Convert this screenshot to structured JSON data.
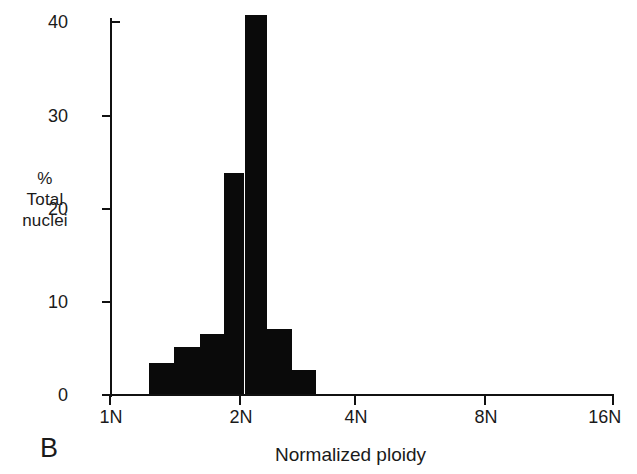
{
  "figure": {
    "panel_letter": "B",
    "background_color": "#ffffff",
    "ink_color": "#0a0a0a"
  },
  "axes": {
    "y_label_lines": [
      "%",
      "Total",
      "nuclei"
    ],
    "x_title": "Normalized ploidy",
    "y_ticks": [
      {
        "label": "0",
        "value": 0
      },
      {
        "label": "10",
        "value": 10
      },
      {
        "label": "20",
        "value": 20
      },
      {
        "label": "30",
        "value": 30
      },
      {
        "label": "40",
        "value": 40
      }
    ],
    "x_ticks": [
      {
        "label": "1N",
        "value": 1
      },
      {
        "label": "2N",
        "value": 2
      },
      {
        "label": "4N",
        "value": 4
      },
      {
        "label": "8N",
        "value": 8
      },
      {
        "label": "16N",
        "value": 16
      }
    ]
  },
  "chart_data": {
    "type": "bar",
    "title": "",
    "subtitle": "",
    "xlabel": "Normalized ploidy",
    "ylabel": "% Total nuclei",
    "xscale": "log2",
    "ylim": [
      0,
      41
    ],
    "xlim": [
      1,
      16
    ],
    "grid": false,
    "legend": null,
    "annotations": [
      {
        "text": "B",
        "position": "bottom-left"
      }
    ],
    "xtick_labels": [
      "1N",
      "2N",
      "4N",
      "8N",
      "16N"
    ],
    "ytick_labels": [
      "0",
      "10",
      "20",
      "30",
      "40"
    ],
    "bar_color": "#0a0a0a",
    "categories": [
      "1.2N",
      "1.4N",
      "1.6N",
      "1.8N",
      "2.1N",
      "2.4N",
      "2.9N"
    ],
    "values": [
      3.4,
      5.2,
      6.5,
      23.8,
      40.8,
      7.1,
      2.7
    ],
    "bars": [
      {
        "label": "1.2N",
        "value": 3.4,
        "x_left": 1.23,
        "x_right": 1.41
      },
      {
        "label": "1.4N",
        "value": 5.2,
        "x_left": 1.41,
        "x_right": 1.62
      },
      {
        "label": "1.6N",
        "value": 6.5,
        "x_left": 1.62,
        "x_right": 1.84
      },
      {
        "label": "1.8N",
        "value": 23.8,
        "x_left": 1.84,
        "x_right": 2.05
      },
      {
        "label": "2.1N",
        "value": 40.8,
        "x_left": 2.05,
        "x_right": 2.31
      },
      {
        "label": "2.4N",
        "value": 7.1,
        "x_left": 2.31,
        "x_right": 2.64
      },
      {
        "label": "2.9N",
        "value": 2.7,
        "x_left": 2.64,
        "x_right": 3.0
      }
    ]
  }
}
